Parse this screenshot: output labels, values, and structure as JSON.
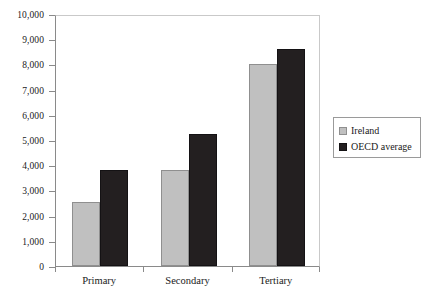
{
  "chart_data": {
    "type": "bar",
    "title": "",
    "subtitle": "",
    "xlabel": "",
    "ylabel": "",
    "categories": [
      "Primary",
      "Secondary",
      "Tertiary"
    ],
    "series": [
      {
        "name": "Ireland",
        "color": "#c0c0c0",
        "values": [
          2550,
          3800,
          8000
        ]
      },
      {
        "name": "OECD average",
        "color": "#231f20",
        "values": [
          3800,
          5250,
          8600
        ]
      }
    ],
    "ylim": [
      0,
      10000
    ],
    "ytick_step": 1000,
    "ytick_labels": [
      "10,000",
      "9,000",
      "8,000",
      "7,000",
      "6,000",
      "5,000",
      "4,000",
      "3,000",
      "2,000",
      "1,000",
      "0"
    ],
    "ytick_values": [
      10000,
      9000,
      8000,
      7000,
      6000,
      5000,
      4000,
      3000,
      2000,
      1000,
      0
    ],
    "grid": false,
    "legend_position": "right",
    "legend_entries": [
      "Ireland",
      "OECD average"
    ]
  },
  "legend": {
    "items": [
      {
        "label": "Ireland",
        "swatch": "legend-swatch-ireland"
      },
      {
        "label": "OECD average",
        "swatch": "legend-swatch-oecd"
      }
    ]
  }
}
